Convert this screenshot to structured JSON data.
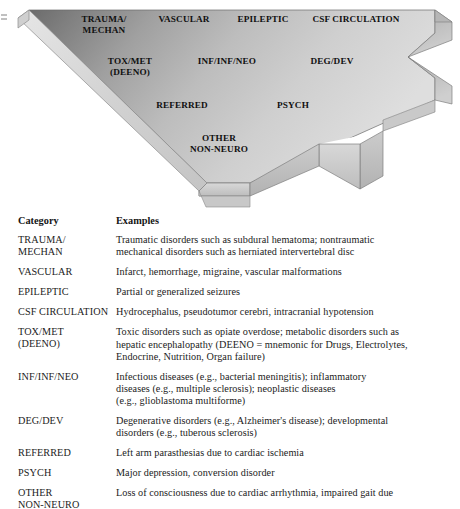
{
  "figure": {
    "name": "neurologic-differential-diagnosis-arrow",
    "accent_dark": "#6e6e6e",
    "accent_light": "#d9d9d9",
    "edge_color": "#8a8a8a",
    "labels": [
      {
        "id": "trauma",
        "text": "TRAUMA/\nMECHAN",
        "x": 62,
        "y": 14,
        "w": 84
      },
      {
        "id": "vascular",
        "text": "VASCULAR",
        "x": 146,
        "y": 14,
        "w": 76
      },
      {
        "id": "epileptic",
        "text": "EPILEPTIC",
        "x": 228,
        "y": 14,
        "w": 70
      },
      {
        "id": "csf",
        "text": "CSF CIRCULATION",
        "x": 300,
        "y": 14,
        "w": 112
      },
      {
        "id": "toxmet",
        "text": "TOX/MET\n(DEENO)",
        "x": 90,
        "y": 56,
        "w": 80
      },
      {
        "id": "infinfneo",
        "text": "INF/INF/NEO",
        "x": 184,
        "y": 56,
        "w": 86
      },
      {
        "id": "degdev",
        "text": "DEG/DEV",
        "x": 296,
        "y": 56,
        "w": 72
      },
      {
        "id": "referred",
        "text": "REFERRED",
        "x": 142,
        "y": 100,
        "w": 80
      },
      {
        "id": "psych",
        "text": "PSYCH",
        "x": 264,
        "y": 100,
        "w": 58
      },
      {
        "id": "other",
        "text": "OTHER\nNON-NEURO",
        "x": 172,
        "y": 133,
        "w": 94
      }
    ]
  },
  "table": {
    "headers": {
      "category": "Category",
      "examples": "Examples"
    },
    "rows": [
      {
        "category": "TRAUMA/\nMECHAN",
        "examples": "Traumatic disorders such as subdural hematoma; nontraumatic\nmechanical disorders such as herniated intervertebral disc"
      },
      {
        "category": "VASCULAR",
        "examples": "Infarct, hemorrhage, migraine, vascular malformations"
      },
      {
        "category": "EPILEPTIC",
        "examples": "Partial or generalized seizures"
      },
      {
        "category": "CSF CIRCULATION",
        "examples": "Hydrocephalus, pseudotumor cerebri, intracranial hypotension"
      },
      {
        "category": "TOX/MET\n(DEENO)",
        "examples": "Toxic disorders such as opiate overdose; metabolic disorders such as\nhepatic encephalopathy (DEENO = mnemonic for Drugs, Electrolytes,\nEndocrine, Nutrition, Organ failure)"
      },
      {
        "category": "INF/INF/NEO",
        "examples": "Infectious diseases (e.g., bacterial meningitis); inflammatory\ndiseases (e.g., multiple sclerosis); neoplastic diseases\n(e.g., glioblastoma multiforme)"
      },
      {
        "category": "DEG/DEV",
        "examples": "Degenerative disorders (e.g., Alzheimer's disease); developmental\ndisorders (e.g., tuberous sclerosis)"
      },
      {
        "category": "REFERRED",
        "examples": "Left arm parasthesias due to cardiac ischemia"
      },
      {
        "category": "PSYCH",
        "examples": "Major depression, conversion disorder"
      },
      {
        "category": "OTHER\nNON-NEURO",
        "examples": "Loss of consciousness due to cardiac arrhythmia, impaired gait due"
      }
    ]
  }
}
